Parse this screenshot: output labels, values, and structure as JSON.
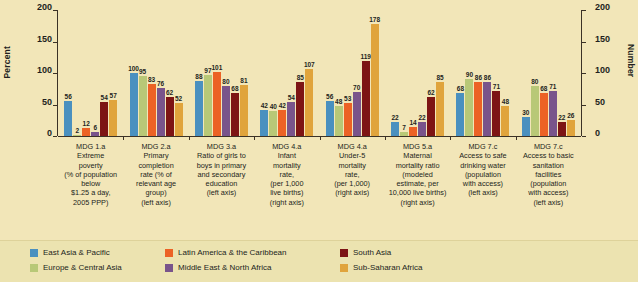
{
  "axes": {
    "left_title": "Percent",
    "right_title": "Number",
    "left_ticks": [
      "200",
      "150",
      "100",
      "50",
      "0"
    ],
    "right_ticks": [
      "200",
      "150",
      "100",
      "50",
      "0"
    ],
    "ymin": 0,
    "ymax": 200
  },
  "legend": {
    "items": [
      {
        "label": "East Asia & Pacific",
        "color": "#4a90bf"
      },
      {
        "label": "Europe & Central Asia",
        "color": "#b8c877"
      },
      {
        "label": "Latin America & the Caribbean",
        "color": "#ec6225"
      },
      {
        "label": "Middle East & North Africa",
        "color": "#79548b"
      },
      {
        "label": "South Asia",
        "color": "#7d1414"
      },
      {
        "label": "Sub-Saharan Africa",
        "color": "#e0a43c"
      }
    ]
  },
  "chart_data": {
    "type": "bar",
    "title": "",
    "xlabel": "",
    "ylabel": "Percent",
    "ylabel_right": "Number",
    "ylim": [
      0,
      200
    ],
    "grid": false,
    "legend_position": "bottom",
    "categories": [
      {
        "lines": [
          "MDG 1.a",
          "Extreme",
          "poverty",
          "(% of population",
          "below",
          "$1.25 a day,",
          "2005 PPP)"
        ],
        "axis": "left"
      },
      {
        "lines": [
          "MDG 2.a",
          "Primary",
          "completion",
          "rate (% of",
          "relevant age",
          "group)",
          "(left axis)"
        ],
        "axis": "left"
      },
      {
        "lines": [
          "MDG 3.a",
          "Ratio of girls to",
          "boys in primary",
          "and secondary",
          "education",
          "(left axis)"
        ],
        "axis": "left"
      },
      {
        "lines": [
          "MDG 4.a",
          "Infant",
          "mortality",
          "rate,",
          "(per 1,000",
          "live births)",
          "(right axis)"
        ],
        "axis": "right"
      },
      {
        "lines": [
          "MDG 4.a",
          "Under-5",
          "mortality",
          "rate,",
          "(per 1,000)",
          "(right axis)"
        ],
        "axis": "right"
      },
      {
        "lines": [
          "MDG 5.a",
          "Maternal",
          "mortality ratio",
          "(modeled",
          "estimate, per",
          "10,000 live births)",
          "(right axis)"
        ],
        "axis": "right"
      },
      {
        "lines": [
          "MDG 7.c",
          "Access to safe",
          "drinking water",
          "(population",
          "with access)",
          "(left axis)"
        ],
        "axis": "left"
      },
      {
        "lines": [
          "MDG 7.c",
          "Access to basic",
          "sanitation",
          "facilities",
          "(population",
          "with access)",
          "(left axis)"
        ],
        "axis": "left"
      }
    ],
    "series": [
      {
        "name": "East Asia & Pacific",
        "color": "#4a90bf",
        "values": [
          56,
          100,
          88,
          42,
          56,
          22,
          68,
          30
        ]
      },
      {
        "name": "Europe & Central Asia",
        "color": "#b8c877",
        "values": [
          2,
          95,
          97,
          40,
          48,
          7,
          90,
          80
        ]
      },
      {
        "name": "Latin America & the Caribbean",
        "color": "#ec6225",
        "values": [
          12,
          83,
          101,
          42,
          53,
          14,
          86,
          68
        ]
      },
      {
        "name": "Middle East & North Africa",
        "color": "#79548b",
        "values": [
          6,
          76,
          80,
          54,
          70,
          22,
          86,
          71
        ]
      },
      {
        "name": "South Asia",
        "color": "#7d1414",
        "values": [
          54,
          62,
          68,
          85,
          119,
          62,
          71,
          22
        ]
      },
      {
        "name": "Sub-Saharan Africa",
        "color": "#e0a43c",
        "values": [
          57,
          52,
          81,
          107,
          178,
          85,
          48,
          26
        ]
      }
    ]
  }
}
